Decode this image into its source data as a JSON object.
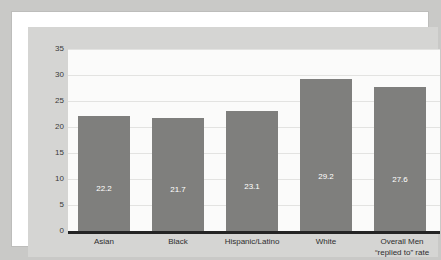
{
  "chart_data": {
    "type": "bar",
    "title": "",
    "subtitle": "",
    "xlabel": "",
    "ylabel": "",
    "ylim": [
      0,
      35
    ],
    "ytick_step": 5,
    "yticks": [
      "35",
      "30",
      "25",
      "20",
      "15",
      "10",
      "5",
      "0"
    ],
    "grid": true,
    "legend": "none",
    "categories": [
      {
        "lines": [
          "Asian"
        ]
      },
      {
        "lines": [
          "Black"
        ]
      },
      {
        "lines": [
          "Hispanic/Latino"
        ]
      },
      {
        "lines": [
          "White"
        ]
      },
      {
        "lines": [
          "Overall Men",
          "“replied to” rate"
        ]
      }
    ],
    "values": [
      22.2,
      21.7,
      23.1,
      29.2,
      27.6
    ],
    "value_labels": [
      "22.2",
      "21.7",
      "23.1",
      "29.2",
      "27.6"
    ],
    "colors": {
      "bar": "#7f7f7d",
      "value_label": "#ffffff",
      "plot_background": "#fbfbfa",
      "panel_background": "#d5d5d3",
      "page_background": "#c9c9c7",
      "axis_line": "#242424",
      "gridline": "#e3e3e1",
      "tick_text": "#3a3a3a",
      "category_text": "#2e2e2e"
    }
  }
}
